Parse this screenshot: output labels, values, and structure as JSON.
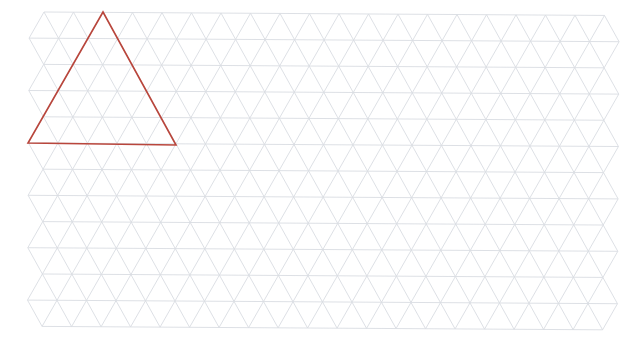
{
  "grid": {
    "origin_x": 44,
    "origin_y": 12,
    "side": 29.5,
    "row_height": 26.2,
    "rows": 12,
    "cols": 19,
    "rotation_deg": 0.35,
    "stroke": "#d9dde2",
    "stroke_width": 0.9
  },
  "highlight": {
    "points": [
      [
        103,
        12
      ],
      [
        28,
        143
      ],
      [
        176,
        145
      ]
    ],
    "stroke": "#b9463c",
    "stroke_width": 1.6,
    "label": "highlighted-triangle"
  }
}
